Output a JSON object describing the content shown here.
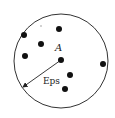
{
  "diagram": {
    "circle": {
      "cx": 61,
      "cy": 61,
      "r": 47,
      "stroke": "#333333"
    },
    "center_label": "A",
    "radius_label": "Eps",
    "points": [
      {
        "x": 24,
        "y": 35
      },
      {
        "x": 59,
        "y": 29
      },
      {
        "x": 41,
        "y": 44
      },
      {
        "x": 25,
        "y": 56
      },
      {
        "x": 61,
        "y": 60
      },
      {
        "x": 103,
        "y": 64
      },
      {
        "x": 70,
        "y": 75
      },
      {
        "x": 65,
        "y": 89
      }
    ],
    "point_color": "#111111"
  }
}
